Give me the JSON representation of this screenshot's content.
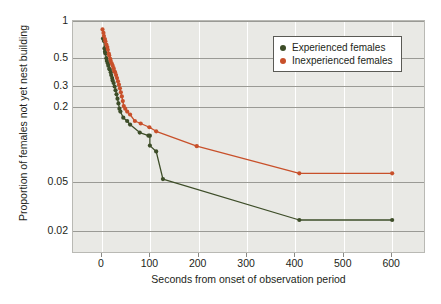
{
  "chart_data": {
    "type": "line",
    "title": "",
    "xlabel": "Seconds from onset of observation period",
    "ylabel": "Proportion of females not yet nest building",
    "xscale": "linear",
    "yscale": "log",
    "xlim": [
      -60,
      670
    ],
    "ylim": [
      0.013,
      1.0
    ],
    "xticks": [
      0,
      100,
      200,
      300,
      400,
      500,
      600
    ],
    "xticklabels": [
      "0",
      "100",
      "200",
      "300",
      "400",
      "500",
      "600"
    ],
    "yticks": [
      1,
      0.5,
      0.3,
      0.2,
      0.05,
      0.02
    ],
    "yticklabels": [
      "1",
      "0.5",
      "0.3",
      "0.2",
      "0.05",
      "0.02"
    ],
    "grid": "both",
    "legend_position": "upper right",
    "series": [
      {
        "name": "Experienced females",
        "color": "#3d4d28",
        "marker": "circle",
        "points": [
          [
            2,
            0.72
          ],
          [
            4,
            0.69
          ],
          [
            5,
            0.6
          ],
          [
            6,
            0.565
          ],
          [
            7,
            0.545
          ],
          [
            9,
            0.5
          ],
          [
            10,
            0.475
          ],
          [
            12,
            0.455
          ],
          [
            13,
            0.435
          ],
          [
            15,
            0.41
          ],
          [
            16,
            0.405
          ],
          [
            18,
            0.385
          ],
          [
            19,
            0.365
          ],
          [
            21,
            0.345
          ],
          [
            22,
            0.33
          ],
          [
            24,
            0.315
          ],
          [
            26,
            0.295
          ],
          [
            28,
            0.275
          ],
          [
            30,
            0.255
          ],
          [
            32,
            0.235
          ],
          [
            34,
            0.215
          ],
          [
            36,
            0.195
          ],
          [
            38,
            0.185
          ],
          [
            44,
            0.165
          ],
          [
            52,
            0.155
          ],
          [
            58,
            0.145
          ],
          [
            78,
            0.125
          ],
          [
            96,
            0.118
          ],
          [
            99,
            0.118
          ],
          [
            99,
            0.098
          ],
          [
            112,
            0.088
          ],
          [
            126,
            0.0525
          ],
          [
            408,
            0.0245
          ],
          [
            600,
            0.0245
          ]
        ]
      },
      {
        "name": "Inexperienced females",
        "color": "#c8502a",
        "marker": "circle",
        "points": [
          [
            1,
            0.855
          ],
          [
            3,
            0.8
          ],
          [
            4,
            0.755
          ],
          [
            6,
            0.715
          ],
          [
            7,
            0.685
          ],
          [
            9,
            0.645
          ],
          [
            11,
            0.615
          ],
          [
            12,
            0.585
          ],
          [
            14,
            0.545
          ],
          [
            15,
            0.525
          ],
          [
            17,
            0.495
          ],
          [
            18,
            0.475
          ],
          [
            20,
            0.455
          ],
          [
            22,
            0.435
          ],
          [
            24,
            0.415
          ],
          [
            25,
            0.395
          ],
          [
            27,
            0.385
          ],
          [
            29,
            0.365
          ],
          [
            31,
            0.345
          ],
          [
            33,
            0.325
          ],
          [
            35,
            0.305
          ],
          [
            37,
            0.285
          ],
          [
            39,
            0.265
          ],
          [
            41,
            0.245
          ],
          [
            43,
            0.225
          ],
          [
            45,
            0.205
          ],
          [
            48,
            0.195
          ],
          [
            52,
            0.185
          ],
          [
            58,
            0.175
          ],
          [
            68,
            0.155
          ],
          [
            80,
            0.148
          ],
          [
            98,
            0.138
          ],
          [
            112,
            0.128
          ],
          [
            196,
            0.097
          ],
          [
            408,
            0.0585
          ],
          [
            600,
            0.0585
          ]
        ]
      }
    ]
  },
  "legend": {
    "items": [
      {
        "label": "Experienced females",
        "color": "#3d4d28"
      },
      {
        "label": "Inexperienced females",
        "color": "#c8502a"
      }
    ]
  },
  "colors": {
    "plot_background": "#e9e9e5",
    "gridline": "#ffffff",
    "axis_text": "#231f20",
    "series_experienced": "#3d4d28",
    "series_inexperienced": "#c8502a"
  }
}
